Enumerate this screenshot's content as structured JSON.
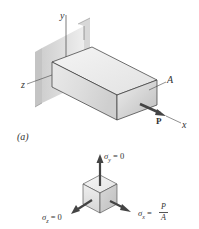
{
  "figure": {
    "part_a": {
      "label": "(a)",
      "axes": {
        "x": "x",
        "y": "y",
        "z": "z"
      },
      "area_label": "A",
      "load_label": "P"
    },
    "stress_element": {
      "sigma_y": {
        "symbol": "σ",
        "subscript": "y",
        "value": "= 0"
      },
      "sigma_z": {
        "symbol": "σ",
        "subscript": "z",
        "value": "= 0"
      },
      "sigma_x": {
        "symbol": "σ",
        "subscript": "x",
        "equals": "=",
        "numerator": "P",
        "denominator": "A"
      }
    },
    "colors": {
      "line": "#333333",
      "wall_light": "#e6e6e6",
      "wall_dark": "#b9b9b9",
      "bar_top": "#f0f0f0",
      "bar_front": "#dcdcdc",
      "bar_end": "#c8c8c8",
      "arrow": "#444444"
    }
  }
}
